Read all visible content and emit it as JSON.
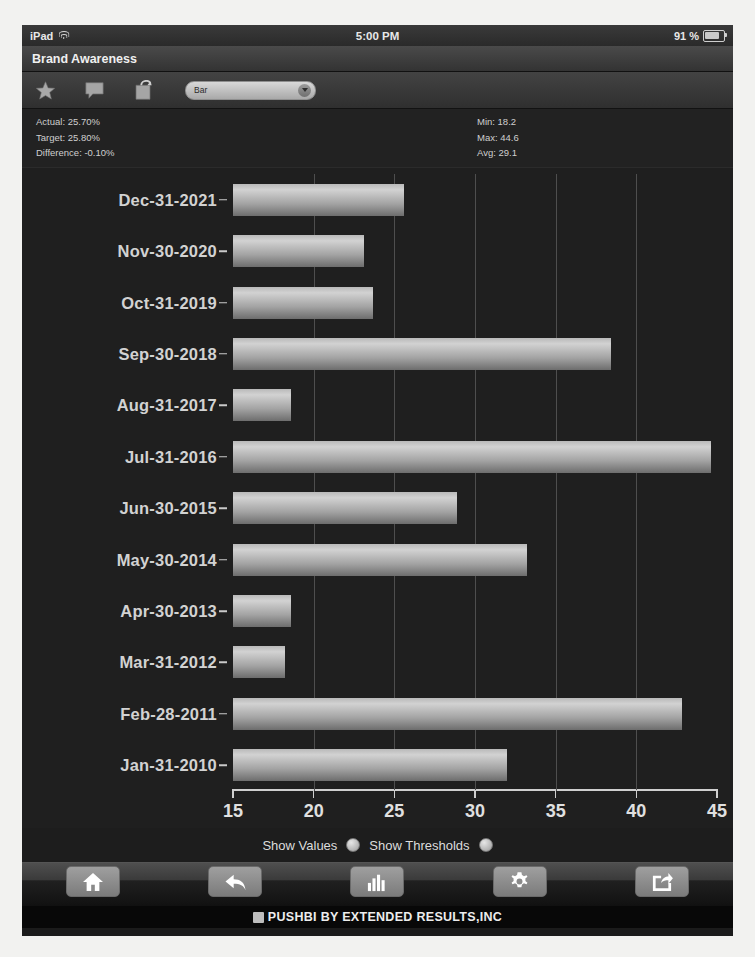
{
  "status_bar": {
    "carrier": "iPad",
    "wifi_icon": "wifi-icon",
    "time": "5:00 PM",
    "battery_percent": "91 %",
    "battery_icon": "battery-icon"
  },
  "title_bar": {
    "title": "Brand Awareness"
  },
  "toolbar": {
    "icons": [
      {
        "name": "star-icon",
        "label": "Favorite"
      },
      {
        "name": "comment-icon",
        "label": "Comment"
      },
      {
        "name": "note-icon",
        "label": "Note"
      }
    ],
    "chart_type_select": {
      "value": "Bar",
      "options": [
        "Bar",
        "Line",
        "Pie",
        "Area",
        "Gauge"
      ],
      "caret_icon": "chevron-down-icon"
    }
  },
  "stats": {
    "left": [
      "Actual: 25.70%",
      "Target: 25.80%",
      "Difference: -0.10%"
    ],
    "right": [
      "Min: 18.2",
      "Max: 44.6",
      "Avg: 29.1"
    ],
    "actual": "25.70%",
    "target": "25.80%",
    "difference": "-0.10%",
    "min": "18.2",
    "max": "44.6",
    "avg": "29.1"
  },
  "chart_data": {
    "type": "bar",
    "orientation": "horizontal",
    "title": "Brand Awareness",
    "xlabel": "",
    "ylabel": "",
    "xlim": [
      15,
      45
    ],
    "xticks": [
      15,
      20,
      25,
      30,
      35,
      40,
      45
    ],
    "grid": true,
    "legend": "none",
    "categories": [
      "Dec-31-2021",
      "Nov-30-2020",
      "Oct-31-2019",
      "Sep-30-2018",
      "Aug-31-2017",
      "Jul-31-2016",
      "Jun-30-2015",
      "May-30-2014",
      "Apr-30-2013",
      "Mar-31-2012",
      "Feb-28-2011",
      "Jan-31-2010"
    ],
    "values": [
      25.6,
      23.1,
      23.7,
      38.4,
      18.6,
      44.6,
      28.9,
      33.2,
      18.6,
      18.2,
      42.8,
      32.0
    ]
  },
  "options": {
    "show_values_label": "Show Values",
    "show_values_state": "off",
    "show_thresholds_label": "Show Thresholds",
    "show_thresholds_state": "off"
  },
  "tab_bar": {
    "buttons": [
      {
        "name": "home-icon",
        "label": "Home"
      },
      {
        "name": "back-arrow-icon",
        "label": "Back"
      },
      {
        "name": "bar-chart-icon",
        "label": "Charts"
      },
      {
        "name": "gear-icon",
        "label": "Settings"
      },
      {
        "name": "share-icon",
        "label": "Share"
      }
    ]
  },
  "footer": {
    "logo_icon": "pushbi-logo-icon",
    "text": "PUSHBI BY EXTENDED RESULTS,INC"
  }
}
